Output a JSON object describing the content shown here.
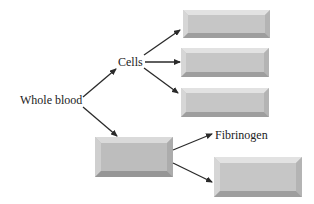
{
  "diagram": {
    "type": "flow",
    "colors": {
      "background": "#ffffff",
      "text": "#222222",
      "arrow": "#2a2a2a",
      "box_face": "#c6c6c6",
      "box_top_bevel": "#e2e2e2",
      "box_left_bevel": "#d6d6d6",
      "box_right_bevel": "#b4b4b4",
      "box_bottom_bevel": "#9e9e9e",
      "plasma_box_face": "#bdbdbd"
    },
    "nodes": [
      {
        "id": "whole_blood",
        "kind": "label",
        "text": "Whole blood"
      },
      {
        "id": "cells",
        "kind": "label",
        "text": "Cells"
      },
      {
        "id": "cells_box_1",
        "kind": "blank-box",
        "text": ""
      },
      {
        "id": "cells_box_2",
        "kind": "blank-box",
        "text": ""
      },
      {
        "id": "cells_box_3",
        "kind": "blank-box",
        "text": ""
      },
      {
        "id": "plasma_box",
        "kind": "blank-box",
        "text": ""
      },
      {
        "id": "fibrinogen",
        "kind": "label",
        "text": "Fibrinogen"
      },
      {
        "id": "serum_box",
        "kind": "blank-box",
        "text": ""
      }
    ],
    "edges": [
      {
        "from": "whole_blood",
        "to": "cells"
      },
      {
        "from": "whole_blood",
        "to": "plasma_box"
      },
      {
        "from": "cells",
        "to": "cells_box_1"
      },
      {
        "from": "cells",
        "to": "cells_box_2"
      },
      {
        "from": "cells",
        "to": "cells_box_3"
      },
      {
        "from": "plasma_box",
        "to": "fibrinogen"
      },
      {
        "from": "plasma_box",
        "to": "serum_box"
      }
    ]
  },
  "labels": {
    "whole_blood": "Whole blood",
    "cells": "Cells",
    "fibrinogen": "Fibrinogen"
  }
}
